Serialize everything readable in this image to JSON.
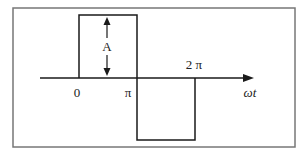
{
  "diagram": {
    "type": "square-wave",
    "amplitude_label": "A",
    "axis_label": "ωt",
    "tick_labels": [
      "0",
      "π",
      "2 π"
    ],
    "segments": [
      {
        "from": "0",
        "to": "π",
        "level": "+A"
      },
      {
        "from": "π",
        "to": "2 π",
        "level": "-A"
      }
    ],
    "colors": {
      "frame": "#777777",
      "line": "#1a1a1a",
      "background": "#ffffff"
    }
  }
}
